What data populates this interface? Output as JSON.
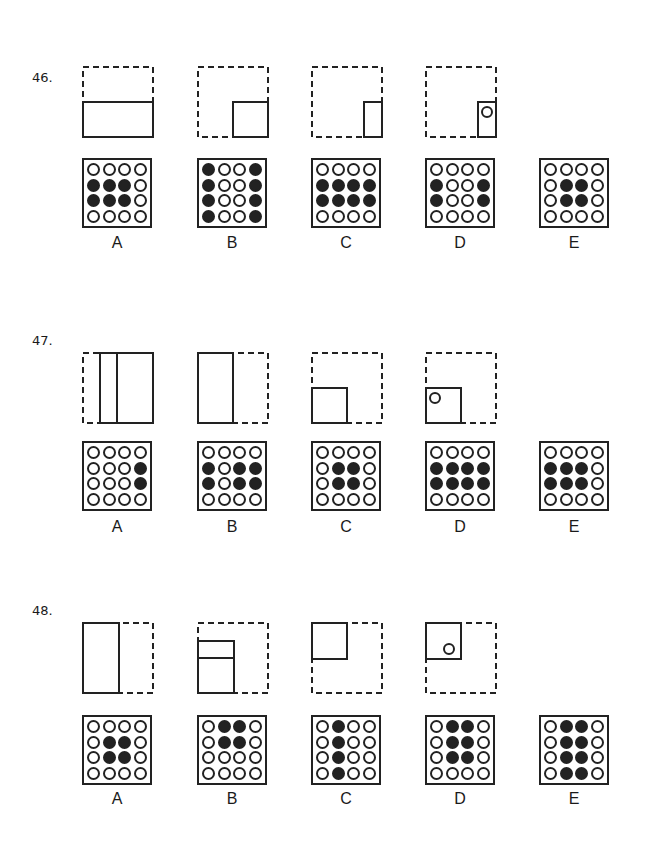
{
  "questions": [
    {
      "number": "46.",
      "folds": [
        "fold-bottom-half",
        "fold-bottom-right-quarter",
        "fold-right-strip",
        "punch-hole-in-strip"
      ],
      "options": [
        {
          "label": "A",
          "grid": [
            "0000",
            "1110",
            "1110",
            "0000"
          ]
        },
        {
          "label": "B",
          "grid": [
            "1001",
            "1001",
            "1001",
            "1001"
          ]
        },
        {
          "label": "C",
          "grid": [
            "0000",
            "1111",
            "1111",
            "0000"
          ]
        },
        {
          "label": "D",
          "grid": [
            "0000",
            "1001",
            "1001",
            "0000"
          ]
        },
        {
          "label": "E",
          "grid": [
            "0000",
            "0110",
            "0110",
            "0000"
          ]
        }
      ]
    },
    {
      "number": "47.",
      "folds": [
        "fold-left-strip-over",
        "fold-left-half",
        "fold-bottom-left-quarter",
        "punch-hole-in-quarter"
      ],
      "options": [
        {
          "label": "A",
          "grid": [
            "0000",
            "0001",
            "0001",
            "0000"
          ]
        },
        {
          "label": "B",
          "grid": [
            "0000",
            "1011",
            "1011",
            "0000"
          ]
        },
        {
          "label": "C",
          "grid": [
            "0000",
            "0110",
            "0110",
            "0000"
          ]
        },
        {
          "label": "D",
          "grid": [
            "0000",
            "1111",
            "1111",
            "0000"
          ]
        },
        {
          "label": "E",
          "grid": [
            "0000",
            "1110",
            "1110",
            "0000"
          ]
        }
      ]
    },
    {
      "number": "48.",
      "folds": [
        "fold-left-half",
        "fold-left-half-with-crease",
        "fold-top-left-quarter",
        "punch-hole-in-quarter"
      ],
      "options": [
        {
          "label": "A",
          "grid": [
            "0000",
            "0110",
            "0110",
            "0000"
          ]
        },
        {
          "label": "B",
          "grid": [
            "0110",
            "0110",
            "0000",
            "0000"
          ]
        },
        {
          "label": "C",
          "grid": [
            "0100",
            "0100",
            "0100",
            "0100"
          ]
        },
        {
          "label": "D",
          "grid": [
            "0110",
            "0110",
            "0110",
            "0000"
          ]
        },
        {
          "label": "E",
          "grid": [
            "0110",
            "0110",
            "0110",
            "0110"
          ]
        }
      ]
    }
  ]
}
